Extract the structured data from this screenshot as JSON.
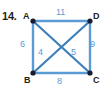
{
  "problem": {
    "number": "14."
  },
  "colors": {
    "edge": "#5b9bd5",
    "vertex": "#1f4e79",
    "label": "#231f20",
    "weight": "#5b9bd5",
    "background": "#ffffff"
  },
  "graph": {
    "vertices": [
      {
        "id": "A",
        "label": "A",
        "x": 33,
        "y": 21
      },
      {
        "id": "D",
        "label": "D",
        "x": 90,
        "y": 21
      },
      {
        "id": "B",
        "label": "B",
        "x": 33,
        "y": 73
      },
      {
        "id": "C",
        "label": "C",
        "x": 90,
        "y": 73
      }
    ],
    "edges": [
      {
        "id": "AD",
        "from": "A",
        "to": "D",
        "weight": "11",
        "position": "top"
      },
      {
        "id": "AB",
        "from": "A",
        "to": "B",
        "weight": "6",
        "position": "left"
      },
      {
        "id": "DC",
        "from": "D",
        "to": "C",
        "weight": "9",
        "position": "right"
      },
      {
        "id": "BC",
        "from": "B",
        "to": "C",
        "weight": "8",
        "position": "bottom"
      },
      {
        "id": "AC",
        "from": "A",
        "to": "C",
        "weight": "4",
        "position": "diagonal-left"
      },
      {
        "id": "BD",
        "from": "B",
        "to": "D",
        "weight": "5",
        "position": "diagonal-right"
      }
    ]
  }
}
